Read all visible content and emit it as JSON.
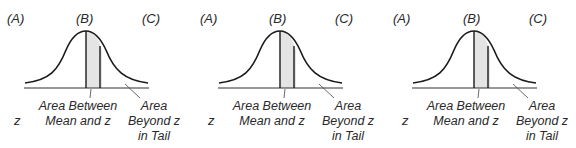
{
  "panels": [
    {
      "col_a": "(A)",
      "col_b": "(B)",
      "col_c": "(C)",
      "z_label": "z",
      "area_between": [
        "Area Between",
        "Mean and z"
      ],
      "area_beyond": [
        "Area",
        "Beyond z",
        "in Tail"
      ]
    },
    {
      "col_a": "(A)",
      "col_b": "(B)",
      "col_c": "(C)",
      "z_label": "z",
      "area_between": [
        "Area Between",
        "Mean and z"
      ],
      "area_beyond": [
        "Area",
        "Beyond z",
        "in Tail"
      ]
    },
    {
      "col_a": "(A)",
      "col_b": "(B)",
      "col_c": "(C)",
      "z_label": "z",
      "area_between": [
        "Area Between",
        "Mean and z"
      ],
      "area_beyond": [
        "Area",
        "Beyond z",
        "in Tail"
      ]
    }
  ],
  "colors": {
    "line": "#1a1a1a",
    "shade": "#e4e4e4",
    "text": "#2a2a2a"
  }
}
